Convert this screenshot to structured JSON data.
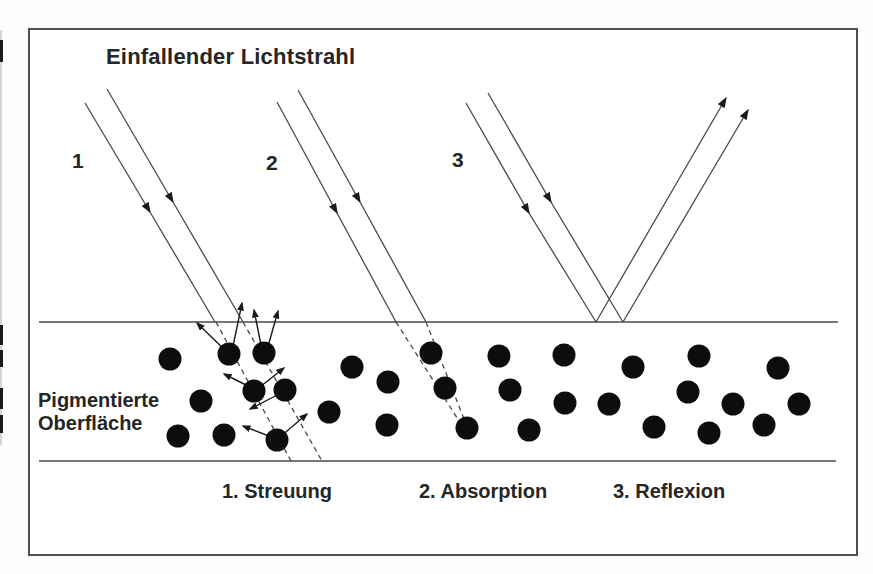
{
  "labels": {
    "title": "Einfallender Lichtstrahl",
    "ray1": "1",
    "ray2": "2",
    "ray3": "3",
    "surface": "Pigmentierte\nOberfläche",
    "caption1": "1. Streuung",
    "caption2": "2. Absorption",
    "caption3": "3. Reflexion"
  },
  "diagram": {
    "colors": {
      "line": "#4a4a4a",
      "arrow": "#1a1a1a",
      "dot": "#0d0d0d",
      "text": "#262626",
      "frame": "#4f4f4f",
      "background": "#ffffff"
    },
    "surface_line": {
      "x1": 39,
      "y": 322,
      "x2": 838
    },
    "bottom_line": {
      "x1": 39,
      "y": 461,
      "x2": 836
    },
    "lines": [
      {
        "name": "incident-ray-1-left-a",
        "x1": 85,
        "y1": 103,
        "x2": 150,
        "y2": 212,
        "arrow": true,
        "dashed": false
      },
      {
        "name": "incident-ray-1-left-b",
        "x1": 150,
        "y1": 212,
        "x2": 215,
        "y2": 322,
        "arrow": false,
        "dashed": false
      },
      {
        "name": "incident-ray-1-right-a",
        "x1": 107,
        "y1": 89,
        "x2": 173,
        "y2": 202,
        "arrow": true,
        "dashed": false
      },
      {
        "name": "incident-ray-1-right-b",
        "x1": 173,
        "y1": 202,
        "x2": 243,
        "y2": 322,
        "arrow": false,
        "dashed": false
      },
      {
        "name": "incident-ray-2-left-a",
        "x1": 277,
        "y1": 102,
        "x2": 337,
        "y2": 213,
        "arrow": true,
        "dashed": false
      },
      {
        "name": "incident-ray-2-left-b",
        "x1": 337,
        "y1": 213,
        "x2": 396,
        "y2": 322,
        "arrow": false,
        "dashed": false
      },
      {
        "name": "incident-ray-2-right-a",
        "x1": 298,
        "y1": 90,
        "x2": 360,
        "y2": 202,
        "arrow": true,
        "dashed": false
      },
      {
        "name": "incident-ray-2-right-b",
        "x1": 360,
        "y1": 202,
        "x2": 426,
        "y2": 322,
        "arrow": false,
        "dashed": false
      },
      {
        "name": "incident-ray-3-left-a",
        "x1": 466,
        "y1": 103,
        "x2": 529,
        "y2": 213,
        "arrow": true,
        "dashed": false
      },
      {
        "name": "incident-ray-3-left-b",
        "x1": 529,
        "y1": 213,
        "x2": 596,
        "y2": 322,
        "arrow": false,
        "dashed": false
      },
      {
        "name": "incident-ray-3-right-a",
        "x1": 488,
        "y1": 93,
        "x2": 551,
        "y2": 202,
        "arrow": true,
        "dashed": false
      },
      {
        "name": "incident-ray-3-right-b",
        "x1": 551,
        "y1": 202,
        "x2": 623,
        "y2": 322,
        "arrow": false,
        "dashed": false
      },
      {
        "name": "reflected-ray-1",
        "x1": 596,
        "y1": 322,
        "x2": 726,
        "y2": 98,
        "arrow": true,
        "dashed": false
      },
      {
        "name": "reflected-ray-2",
        "x1": 623,
        "y1": 322,
        "x2": 748,
        "y2": 110,
        "arrow": true,
        "dashed": false
      },
      {
        "name": "scattered-ray-dashed-1",
        "x1": 216,
        "y1": 322,
        "x2": 291,
        "y2": 461,
        "arrow": false,
        "dashed": true
      },
      {
        "name": "scattered-ray-dashed-2",
        "x1": 243,
        "y1": 322,
        "x2": 322,
        "y2": 461,
        "arrow": false,
        "dashed": true
      },
      {
        "name": "absorbed-ray-dashed-1",
        "x1": 396,
        "y1": 322,
        "x2": 461,
        "y2": 424,
        "arrow": false,
        "dashed": true
      },
      {
        "name": "absorbed-ray-dashed-2",
        "x1": 426,
        "y1": 322,
        "x2": 464,
        "y2": 419,
        "arrow": false,
        "dashed": true
      }
    ],
    "scatter_arrows": [
      {
        "x1": 229,
        "y1": 354,
        "x2": 197,
        "y2": 323
      },
      {
        "x1": 232,
        "y1": 351,
        "x2": 242,
        "y2": 303
      },
      {
        "x1": 262,
        "y1": 350,
        "x2": 254,
        "y2": 310
      },
      {
        "x1": 267,
        "y1": 350,
        "x2": 278,
        "y2": 311
      },
      {
        "x1": 252,
        "y1": 388,
        "x2": 224,
        "y2": 374
      },
      {
        "x1": 256,
        "y1": 390,
        "x2": 284,
        "y2": 368
      },
      {
        "x1": 283,
        "y1": 392,
        "x2": 250,
        "y2": 409
      },
      {
        "x1": 280,
        "y1": 437,
        "x2": 307,
        "y2": 414
      },
      {
        "x1": 274,
        "y1": 438,
        "x2": 243,
        "y2": 426
      }
    ],
    "dot_radius": 11.5,
    "dots": [
      [
        170,
        359
      ],
      [
        229,
        354
      ],
      [
        264,
        353
      ],
      [
        352,
        367
      ],
      [
        388,
        382
      ],
      [
        201,
        401
      ],
      [
        254,
        391
      ],
      [
        285,
        390
      ],
      [
        329,
        412
      ],
      [
        387,
        425
      ],
      [
        178,
        436
      ],
      [
        224,
        435
      ],
      [
        277,
        440
      ],
      [
        431,
        353
      ],
      [
        445,
        388
      ],
      [
        467,
        428
      ],
      [
        499,
        356
      ],
      [
        510,
        390
      ],
      [
        529,
        430
      ],
      [
        564,
        355
      ],
      [
        565,
        403
      ],
      [
        609,
        404
      ],
      [
        633,
        367
      ],
      [
        654,
        427
      ],
      [
        688,
        392
      ],
      [
        699,
        356
      ],
      [
        709,
        433
      ],
      [
        733,
        404
      ],
      [
        764,
        425
      ],
      [
        778,
        368
      ],
      [
        799,
        404
      ]
    ],
    "edge_marks": [
      {
        "top": 40,
        "height": 22
      },
      {
        "top": 325,
        "height": 20
      },
      {
        "top": 350,
        "height": 17
      },
      {
        "top": 388,
        "height": 21
      },
      {
        "top": 415,
        "height": 18
      }
    ]
  }
}
